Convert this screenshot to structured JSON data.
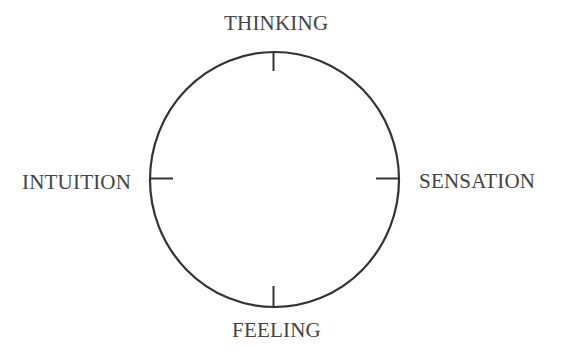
{
  "diagram": {
    "type": "circular-axis-diagram",
    "labels": {
      "top": "THINKING",
      "left": "INTUITION",
      "right": "SENSATION",
      "bottom": "FEELING"
    },
    "circle": {
      "cx": 274.5,
      "cy": 179.5,
      "rx": 124.5,
      "ry": 127.5,
      "stroke": "#333333",
      "stroke_width": 2.2
    },
    "ticks": {
      "length": 20,
      "stroke": "#333333"
    },
    "text_color": "#444444"
  }
}
